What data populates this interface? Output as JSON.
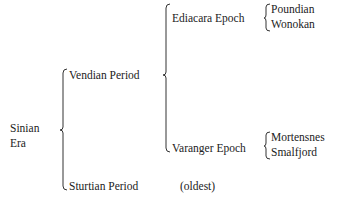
{
  "diagram": {
    "type": "hierarchy-brace-diagram",
    "root": {
      "label_line1": "Sinian",
      "label_line2": "Era"
    },
    "periods": [
      {
        "label": "Vendian Period",
        "epochs": [
          {
            "label": "Ediacara Epoch",
            "stages": [
              "Poundian",
              "Wonokan"
            ]
          },
          {
            "label": "Varanger Epoch",
            "stages": [
              "Mortensnes",
              "Smalfjord"
            ]
          }
        ]
      },
      {
        "label": "Sturtian Period",
        "note": "(oldest)"
      }
    ]
  },
  "colors": {
    "text": "#222222",
    "lines": "#333333",
    "background": "#ffffff"
  }
}
